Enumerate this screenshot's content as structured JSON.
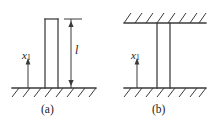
{
  "figure": {
    "type": "engineering-diagram",
    "stroke_color": "#333333",
    "background_color": "#ffffff",
    "panels": [
      {
        "id": "a",
        "caption": "(a)",
        "description": "cantilever column fixed at base, free at top",
        "coordinate_label": "x",
        "coordinate_subscript": "1",
        "coordinate_direction": "up",
        "length_label": "l",
        "supports": [
          "ground"
        ],
        "column_capped_top": true
      },
      {
        "id": "b",
        "caption": "(b)",
        "description": "column fixed at base and at top between two hatched surfaces",
        "coordinate_label": "x",
        "coordinate_subscript": "1",
        "coordinate_direction": "up",
        "length_label": "",
        "supports": [
          "ground",
          "ceiling"
        ],
        "column_capped_top": false
      }
    ]
  }
}
